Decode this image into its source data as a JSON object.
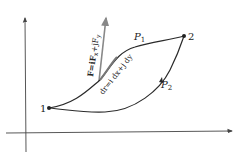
{
  "diagram": {
    "point1_label": "1",
    "point2_label": "2",
    "path1_label": "P",
    "path1_sub": "1",
    "path2_label": "P",
    "path2_sub": "2",
    "force_label": "F=iF",
    "force_label_x": "x",
    "force_label_mid": "+jF",
    "force_label_y": "y",
    "displacement_label": "dr=i dx+j dy",
    "colors": {
      "curve": "#2a2a2a",
      "force_vector": "#888888",
      "axes": "#444444"
    }
  }
}
